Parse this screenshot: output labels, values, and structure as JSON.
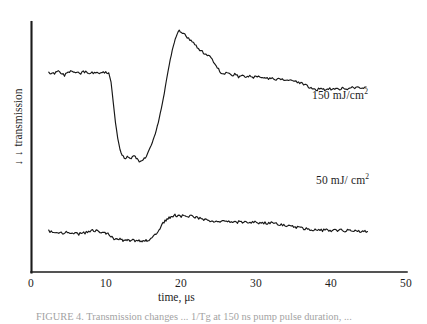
{
  "figure": {
    "background_color": "#ffffff",
    "line_color": "#171717",
    "axis_color": "#1b1b1b",
    "caption_partial": "FIGURE 4. Transmission changes ... 1/Tg at 150 ns pump pulse duration, ...",
    "y_axis": {
      "label": "transmission",
      "arrow_glyph": "↓",
      "arrow_count": 2
    },
    "x_axis": {
      "label": "time, μs",
      "ticks": [
        "0",
        "10",
        "20",
        "30",
        "40",
        "50"
      ]
    },
    "annotations": [
      {
        "name": "upper-trace-label",
        "text": "150 mJ/cm",
        "exponent": "2"
      },
      {
        "name": "lower-trace-label",
        "text": "50 mJ/ cm",
        "exponent": "2"
      }
    ]
  },
  "chart_data": {
    "type": "line",
    "title": "",
    "xlabel": "time, μs",
    "ylabel": "transmission",
    "xlim": [
      0,
      50
    ],
    "ylim": [
      0,
      1
    ],
    "grid": false,
    "legend": "inline-annotations",
    "y_axis_direction": "decreasing-downward",
    "y_units": "arbitrary (offset traces)",
    "xticks": [
      0,
      10,
      20,
      30,
      40,
      50
    ],
    "yticks": [],
    "series": [
      {
        "name": "150 mJ/cm2",
        "label": "150 mJ/cm²",
        "fluence_mJ_per_cm2": 150,
        "x": [
          2.3,
          2.9,
          3.4,
          3.9,
          4.4,
          4.9,
          5.4,
          5.9,
          6.4,
          6.9,
          7.4,
          7.9,
          8.4,
          8.9,
          9.4,
          9.9,
          10.3,
          10.6,
          10.9,
          11.2,
          11.5,
          11.8,
          12.1,
          12.5,
          12.9,
          13.3,
          13.7,
          14.1,
          14.5,
          14.9,
          15.3,
          15.7,
          16.1,
          16.5,
          16.9,
          17.3,
          17.7,
          18.1,
          18.5,
          18.9,
          19.3,
          19.7,
          20.1,
          20.6,
          21.1,
          21.6,
          22.1,
          22.6,
          23.1,
          23.6,
          24.1,
          24.6,
          25.1,
          25.6,
          26.1,
          26.6,
          27.1,
          27.6,
          28.1,
          28.6,
          29.1,
          29.6,
          30.1,
          30.6,
          31.1,
          31.6,
          32.1,
          32.6,
          33.1,
          33.6,
          34.1,
          34.6,
          35.1,
          35.6,
          36.1,
          36.6,
          37.1,
          37.6,
          38.1,
          38.6,
          39.1,
          39.6,
          40.1,
          40.6,
          41.1,
          41.6,
          42.1,
          42.6,
          43.1,
          43.6,
          44.1,
          44.6
        ],
        "y": [
          0.742,
          0.736,
          0.748,
          0.74,
          0.73,
          0.744,
          0.752,
          0.745,
          0.737,
          0.746,
          0.743,
          0.738,
          0.744,
          0.741,
          0.745,
          0.742,
          0.74,
          0.7,
          0.61,
          0.52,
          0.45,
          0.4,
          0.372,
          0.36,
          0.368,
          0.362,
          0.375,
          0.358,
          0.345,
          0.352,
          0.368,
          0.4,
          0.43,
          0.47,
          0.52,
          0.58,
          0.65,
          0.73,
          0.8,
          0.86,
          0.905,
          0.93,
          0.92,
          0.905,
          0.89,
          0.875,
          0.855,
          0.838,
          0.828,
          0.818,
          0.8,
          0.775,
          0.748,
          0.735,
          0.742,
          0.728,
          0.736,
          0.724,
          0.732,
          0.722,
          0.73,
          0.72,
          0.726,
          0.718,
          0.722,
          0.715,
          0.718,
          0.712,
          0.715,
          0.71,
          0.712,
          0.708,
          0.705,
          0.7,
          0.692,
          0.684,
          0.676,
          0.67,
          0.666,
          0.67,
          0.664,
          0.672,
          0.666,
          0.674,
          0.668,
          0.676,
          0.67,
          0.678,
          0.672,
          0.68,
          0.674,
          0.678
        ]
      },
      {
        "name": "50 mJ/cm2",
        "label": "50 mJ/ cm²",
        "fluence_mJ_per_cm2": 50,
        "x": [
          2.3,
          2.8,
          3.3,
          3.8,
          4.3,
          4.8,
          5.3,
          5.8,
          6.3,
          6.8,
          7.3,
          7.8,
          8.3,
          8.8,
          9.3,
          9.8,
          10.2,
          10.6,
          11.0,
          11.4,
          11.8,
          12.2,
          12.6,
          13.0,
          13.4,
          13.8,
          14.2,
          14.6,
          15.0,
          15.4,
          15.8,
          16.2,
          16.6,
          17.0,
          17.4,
          17.8,
          18.2,
          18.6,
          19.0,
          19.4,
          19.8,
          20.3,
          20.8,
          21.3,
          21.8,
          22.3,
          22.8,
          23.3,
          23.8,
          24.3,
          24.8,
          25.3,
          25.8,
          26.3,
          26.8,
          27.3,
          27.8,
          28.3,
          28.8,
          29.3,
          29.8,
          30.3,
          30.8,
          31.3,
          31.8,
          32.3,
          32.8,
          33.3,
          33.8,
          34.3,
          34.8,
          35.3,
          35.8,
          36.3,
          36.8,
          37.3,
          37.8,
          38.3,
          38.8,
          39.3,
          39.8,
          40.3,
          40.8,
          41.3,
          41.8,
          42.3,
          42.8,
          43.3,
          43.8,
          44.3,
          44.8
        ],
        "y": [
          0.42,
          0.408,
          0.398,
          0.404,
          0.396,
          0.412,
          0.392,
          0.404,
          0.386,
          0.398,
          0.404,
          0.418,
          0.428,
          0.42,
          0.408,
          0.4,
          0.396,
          0.36,
          0.33,
          0.322,
          0.33,
          0.318,
          0.326,
          0.314,
          0.322,
          0.312,
          0.318,
          0.308,
          0.314,
          0.318,
          0.326,
          0.35,
          0.39,
          0.44,
          0.49,
          0.53,
          0.56,
          0.58,
          0.596,
          0.588,
          0.58,
          0.59,
          0.578,
          0.586,
          0.572,
          0.56,
          0.552,
          0.544,
          0.536,
          0.528,
          0.534,
          0.524,
          0.53,
          0.52,
          0.526,
          0.518,
          0.524,
          0.514,
          0.52,
          0.512,
          0.518,
          0.508,
          0.514,
          0.506,
          0.512,
          0.504,
          0.498,
          0.49,
          0.484,
          0.476,
          0.47,
          0.462,
          0.456,
          0.448,
          0.442,
          0.436,
          0.43,
          0.436,
          0.428,
          0.434,
          0.426,
          0.432,
          0.424,
          0.43,
          0.422,
          0.428,
          0.42,
          0.426,
          0.418,
          0.424,
          0.416
        ]
      }
    ]
  }
}
